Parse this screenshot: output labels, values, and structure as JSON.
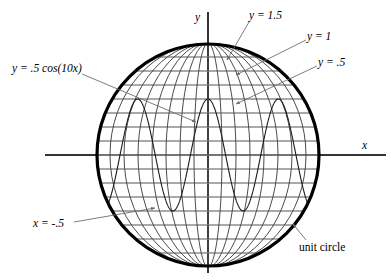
{
  "figure": {
    "background_color": "#ffffff",
    "width": 391,
    "height": 280
  },
  "axes": {
    "x_label": "x",
    "y_label": "y",
    "origin_px": {
      "x": 208,
      "y": 155
    },
    "x_axis_px": {
      "x1": 45,
      "x2": 386,
      "y": 155
    },
    "y_axis_px": {
      "x": 208,
      "y1": 12,
      "y2": 273
    },
    "color": "#333333"
  },
  "circle": {
    "label": "unit circle",
    "center_px": {
      "x": 208,
      "y": 155
    },
    "radius_px": 112,
    "stroke_color": "#000000",
    "stroke_width": 3.2
  },
  "labels": [
    {
      "id": "curve",
      "text": "y = .5 cos(10x)",
      "style": "italic"
    },
    {
      "id": "y15",
      "text": "y = 1.5",
      "style": "italic"
    },
    {
      "id": "y1",
      "text": "y = 1",
      "style": "italic"
    },
    {
      "id": "y05",
      "text": "y = .5",
      "style": "italic"
    },
    {
      "id": "xneg05",
      "text": "x = -.5",
      "style": "italic"
    },
    {
      "id": "unitcircle",
      "text": "unit circle",
      "style": "plain"
    }
  ],
  "colors": {
    "grid_horizontal": "#8c8c8c",
    "grid_meridian": "#4a4a4a",
    "cosine_curve": "#1a1a1a",
    "leader_line": "#6e6e6e",
    "axis": "#333333",
    "circle_outline": "#000000"
  },
  "chart_data": {
    "type": "line",
    "xlabel": "x",
    "ylabel": "y",
    "xlim": [
      -1.55,
      1.6
    ],
    "ylim": [
      -1.2,
      1.2
    ],
    "grid": true,
    "legend": "none",
    "aspect": "equal",
    "series": [
      {
        "name": "unit circle",
        "kind": "circle",
        "center": [
          0,
          0
        ],
        "radius": 1,
        "color": "#000000",
        "linewidth": 3.2
      },
      {
        "name": "y = .5 cos(10x)",
        "kind": "cosine",
        "amplitude": 0.5,
        "frequency": 10,
        "expression": "y = .5 cos(10x)",
        "x_range": [
          -1,
          1
        ],
        "y_range": [
          -0.5,
          0.5
        ],
        "color": "#1a1a1a",
        "linewidth": 1.0,
        "clipped_to_circle": true
      },
      {
        "name": "y = constant horizontal grid lines",
        "kind": "horizontal-lines",
        "values": [
          1.0,
          0.875,
          0.75,
          0.625,
          0.5,
          0.375,
          0.25,
          0.125,
          0.0,
          -0.125,
          -0.25,
          -0.375,
          -0.5,
          -0.625,
          -0.75,
          -0.875,
          -1.0
        ],
        "labeled_values": [
          1.5,
          1.0,
          0.5
        ],
        "color": "#8c8c8c",
        "linewidth": 1.6,
        "clipped_to_circle": true
      },
      {
        "name": "x = constant meridian curves",
        "kind": "meridian-ellipses",
        "values": [
          -1.0,
          -0.875,
          -0.75,
          -0.625,
          -0.5,
          -0.375,
          -0.25,
          -0.125,
          0.0,
          0.125,
          0.25,
          0.375,
          0.5,
          0.625,
          0.75,
          0.875,
          1.0
        ],
        "labeled_values": [
          -0.5
        ],
        "color": "#4a4a4a",
        "linewidth": 1.0,
        "clipped_to_circle": true
      }
    ],
    "annotations": [
      {
        "text": "y = 1.5",
        "target_xy": [
          0.28,
          0.86
        ],
        "label_xy": [
          0.72,
          1.16
        ]
      },
      {
        "text": "y = 1",
        "target_xy": [
          0.3,
          0.73
        ],
        "label_xy": [
          1.22,
          0.97
        ]
      },
      {
        "text": "y = .5",
        "target_xy": [
          0.33,
          0.47
        ],
        "label_xy": [
          1.33,
          0.73
        ]
      },
      {
        "text": "y = .5 cos(10x)",
        "target_xy": [
          -0.06,
          0.22
        ],
        "label_xy": [
          -1.42,
          0.6
        ]
      },
      {
        "text": "x = -.5",
        "target_xy": [
          -0.5,
          -0.56
        ],
        "label_xy": [
          -1.28,
          -0.8
        ]
      },
      {
        "text": "unit circle",
        "target_xy": null,
        "label_xy": [
          0.88,
          -1.02
        ]
      }
    ]
  }
}
